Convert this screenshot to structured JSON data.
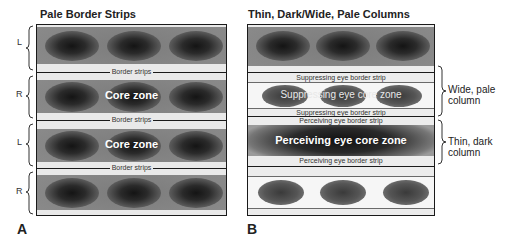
{
  "panel_a": {
    "title": "Pale Border Strips",
    "letter": "A",
    "row_labels": [
      "L",
      "R",
      "L",
      "R"
    ],
    "border_strip_label": "Border strips",
    "core_zone_label": "Core zone"
  },
  "panel_b": {
    "title": "Thin, Dark/Wide, Pale Columns",
    "letter": "B",
    "suppressing_border_label": "Suppressing eye border strip",
    "suppressing_core_label": "Suppressing eye core zone",
    "perceiving_border_label": "Perceiving eye border strip",
    "perceiving_core_label": "Perceiving eye core zone",
    "brace_labels": {
      "wide_pale": {
        "line1": "Wide, pale",
        "line2": "column"
      },
      "thin_dark": {
        "line1": "Thin, dark",
        "line2": "column"
      }
    }
  },
  "colors": {
    "outline": "#1a1a1a",
    "pale_strip": "#e9e9e9",
    "dark_core": "#141414",
    "band_grey": "#8a8a8a"
  }
}
